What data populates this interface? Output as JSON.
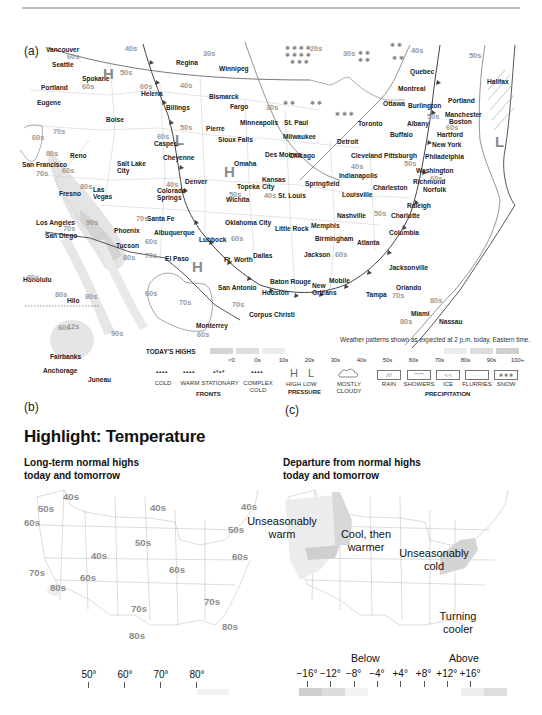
{
  "page": {
    "panels": {
      "a": "(a)",
      "b": "(b)",
      "c": "(c)"
    },
    "heading": "Highlight: Temperature"
  },
  "map_a": {
    "note": "Weather patterns shown as expected at 2 p.m. today, Eastern time.",
    "cities": [
      {
        "name": "Vancouver",
        "x": 46,
        "y": 47
      },
      {
        "name": "Seattle",
        "x": 52,
        "y": 62
      },
      {
        "name": "Spokane",
        "x": 82,
        "y": 76
      },
      {
        "name": "Portland",
        "x": 41,
        "y": 85
      },
      {
        "name": "Eugene",
        "x": 37,
        "y": 100
      },
      {
        "name": "Boise",
        "x": 106,
        "y": 117
      },
      {
        "name": "Helena",
        "x": 141,
        "y": 91
      },
      {
        "name": "Billings",
        "x": 166,
        "y": 105
      },
      {
        "name": "Regina",
        "x": 176,
        "y": 60
      },
      {
        "name": "Winnipeg",
        "x": 219,
        "y": 66
      },
      {
        "name": "Bismarck",
        "x": 209,
        "y": 94
      },
      {
        "name": "Fargo",
        "x": 230,
        "y": 104
      },
      {
        "name": "Minneapolis",
        "x": 240,
        "y": 120
      },
      {
        "name": "St. Paul",
        "x": 284,
        "y": 120
      },
      {
        "name": "Pierre",
        "x": 206,
        "y": 126
      },
      {
        "name": "Sioux Falls",
        "x": 218,
        "y": 137
      },
      {
        "name": "Casper",
        "x": 154,
        "y": 141
      },
      {
        "name": "Cheyenne",
        "x": 163,
        "y": 155
      },
      {
        "name": "Reno",
        "x": 70,
        "y": 153
      },
      {
        "name": "San Francisco",
        "x": 22,
        "y": 162
      },
      {
        "name": "Salt Lake\nCity",
        "x": 117,
        "y": 161
      },
      {
        "name": "Omaha",
        "x": 234,
        "y": 161
      },
      {
        "name": "Des Moines",
        "x": 265,
        "y": 152
      },
      {
        "name": "Chicago",
        "x": 289,
        "y": 153
      },
      {
        "name": "Milwaukee",
        "x": 283,
        "y": 134
      },
      {
        "name": "Detroit",
        "x": 337,
        "y": 139
      },
      {
        "name": "Toronto",
        "x": 358,
        "y": 121
      },
      {
        "name": "Ottawa",
        "x": 383,
        "y": 101
      },
      {
        "name": "Montreal",
        "x": 398,
        "y": 86
      },
      {
        "name": "Quebec",
        "x": 410,
        "y": 69
      },
      {
        "name": "Burlington",
        "x": 408,
        "y": 103
      },
      {
        "name": "Portland",
        "x": 448,
        "y": 98
      },
      {
        "name": "Manchester",
        "x": 445,
        "y": 112
      },
      {
        "name": "Boston",
        "x": 449,
        "y": 119
      },
      {
        "name": "Albany",
        "x": 407,
        "y": 121
      },
      {
        "name": "Buffalo",
        "x": 390,
        "y": 132
      },
      {
        "name": "Hartford",
        "x": 437,
        "y": 132
      },
      {
        "name": "New York",
        "x": 432,
        "y": 142
      },
      {
        "name": "Philadelphia",
        "x": 425,
        "y": 154
      },
      {
        "name": "Washington",
        "x": 416,
        "y": 168
      },
      {
        "name": "Richmond",
        "x": 413,
        "y": 179
      },
      {
        "name": "Norfolk",
        "x": 423,
        "y": 187
      },
      {
        "name": "Pittsburgh",
        "x": 384,
        "y": 153
      },
      {
        "name": "Cleveland",
        "x": 351,
        "y": 153
      },
      {
        "name": "Indianapolis",
        "x": 339,
        "y": 173
      },
      {
        "name": "Charleston",
        "x": 373,
        "y": 185
      },
      {
        "name": "Louisville",
        "x": 342,
        "y": 192
      },
      {
        "name": "Springfield",
        "x": 305,
        "y": 181
      },
      {
        "name": "Kansas\nCity",
        "x": 262,
        "y": 177
      },
      {
        "name": "St. Louis",
        "x": 278,
        "y": 193
      },
      {
        "name": "Topeka",
        "x": 237,
        "y": 184
      },
      {
        "name": "Wichita",
        "x": 226,
        "y": 197
      },
      {
        "name": "Denver",
        "x": 185,
        "y": 179
      },
      {
        "name": "Colorado\nSprings",
        "x": 157,
        "y": 188
      },
      {
        "name": "Fresno",
        "x": 59,
        "y": 191
      },
      {
        "name": "Las\nVegas",
        "x": 93,
        "y": 187
      },
      {
        "name": "Los Angeles",
        "x": 36,
        "y": 220
      },
      {
        "name": "San Diego",
        "x": 45,
        "y": 233
      },
      {
        "name": "Phoenix",
        "x": 114,
        "y": 228
      },
      {
        "name": "Tucson",
        "x": 116,
        "y": 243
      },
      {
        "name": "Santa Fe",
        "x": 147,
        "y": 216
      },
      {
        "name": "Albuquerque",
        "x": 154,
        "y": 230
      },
      {
        "name": "Oklahoma City",
        "x": 225,
        "y": 220
      },
      {
        "name": "Lubbock",
        "x": 199,
        "y": 237
      },
      {
        "name": "El Paso",
        "x": 165,
        "y": 256
      },
      {
        "name": "Dallas",
        "x": 253,
        "y": 253
      },
      {
        "name": "Ft. Worth",
        "x": 224,
        "y": 257
      },
      {
        "name": "Little Rock",
        "x": 275,
        "y": 226
      },
      {
        "name": "Memphis",
        "x": 311,
        "y": 223
      },
      {
        "name": "Nashville",
        "x": 337,
        "y": 213
      },
      {
        "name": "Birmingham",
        "x": 315,
        "y": 236
      },
      {
        "name": "Atlanta",
        "x": 357,
        "y": 240
      },
      {
        "name": "Charlotte",
        "x": 391,
        "y": 213
      },
      {
        "name": "Raleigh",
        "x": 407,
        "y": 203
      },
      {
        "name": "Columbia",
        "x": 389,
        "y": 230
      },
      {
        "name": "Jackson",
        "x": 304,
        "y": 252
      },
      {
        "name": "Jacksonville",
        "x": 389,
        "y": 265
      },
      {
        "name": "Mobile",
        "x": 329,
        "y": 278
      },
      {
        "name": "Baton Rouge",
        "x": 270,
        "y": 279
      },
      {
        "name": "New\nOrleans",
        "x": 312,
        "y": 283
      },
      {
        "name": "Houston",
        "x": 262,
        "y": 290
      },
      {
        "name": "San Antonio",
        "x": 218,
        "y": 285
      },
      {
        "name": "Corpus Christi",
        "x": 249,
        "y": 312
      },
      {
        "name": "Monterrey",
        "x": 196,
        "y": 323
      },
      {
        "name": "Tampa",
        "x": 366,
        "y": 292
      },
      {
        "name": "Orlando",
        "x": 396,
        "y": 285
      },
      {
        "name": "Miami",
        "x": 411,
        "y": 311
      },
      {
        "name": "Nassau",
        "x": 439,
        "y": 319
      },
      {
        "name": "Halifax",
        "x": 487,
        "y": 79
      },
      {
        "name": "Honolulu",
        "x": 23,
        "y": 277
      },
      {
        "name": "Hilo",
        "x": 67,
        "y": 298
      },
      {
        "name": "Fairbanks",
        "x": 50,
        "y": 354
      },
      {
        "name": "Anchorage",
        "x": 43,
        "y": 368
      },
      {
        "name": "Juneau",
        "x": 88,
        "y": 377
      }
    ],
    "temps": [
      {
        "t": "40s",
        "x": 125,
        "y": 45
      },
      {
        "t": "60s",
        "x": 67,
        "y": 53
      },
      {
        "t": "30s",
        "x": 203,
        "y": 50
      },
      {
        "t": "50s",
        "x": 120,
        "y": 69
      },
      {
        "t": "60s",
        "x": 82,
        "y": 83
      },
      {
        "t": "40s",
        "x": 180,
        "y": 82
      },
      {
        "t": "60s",
        "x": 140,
        "y": 83
      },
      {
        "t": "30s",
        "x": 266,
        "y": 104
      },
      {
        "t": "20s",
        "x": 310,
        "y": 45
      },
      {
        "t": "30s",
        "x": 343,
        "y": 50
      },
      {
        "t": "40s",
        "x": 411,
        "y": 47
      },
      {
        "t": "50s",
        "x": 469,
        "y": 52
      },
      {
        "t": "50s",
        "x": 180,
        "y": 124
      },
      {
        "t": "60s",
        "x": 157,
        "y": 133
      },
      {
        "t": "70s",
        "x": 53,
        "y": 128
      },
      {
        "t": "60s",
        "x": 32,
        "y": 134
      },
      {
        "t": "80s",
        "x": 46,
        "y": 150
      },
      {
        "t": "70s",
        "x": 36,
        "y": 170
      },
      {
        "t": "60s",
        "x": 62,
        "y": 167
      },
      {
        "t": "80s",
        "x": 80,
        "y": 183
      },
      {
        "t": "40s",
        "x": 166,
        "y": 181
      },
      {
        "t": "50s",
        "x": 229,
        "y": 191
      },
      {
        "t": "40s",
        "x": 264,
        "y": 192
      },
      {
        "t": "50s",
        "x": 427,
        "y": 113
      },
      {
        "t": "60s",
        "x": 446,
        "y": 124
      },
      {
        "t": "40s",
        "x": 351,
        "y": 163
      },
      {
        "t": "50s",
        "x": 404,
        "y": 160
      },
      {
        "t": "60s",
        "x": 430,
        "y": 175
      },
      {
        "t": "90s",
        "x": 86,
        "y": 219
      },
      {
        "t": "70s",
        "x": 63,
        "y": 225
      },
      {
        "t": "70s",
        "x": 136,
        "y": 215
      },
      {
        "t": "60s",
        "x": 145,
        "y": 238
      },
      {
        "t": "80s",
        "x": 123,
        "y": 254
      },
      {
        "t": "70s",
        "x": 145,
        "y": 252
      },
      {
        "t": "60s",
        "x": 231,
        "y": 235
      },
      {
        "t": "50s",
        "x": 374,
        "y": 210
      },
      {
        "t": "60s",
        "x": 335,
        "y": 251
      },
      {
        "t": "70s",
        "x": 179,
        "y": 299
      },
      {
        "t": "60s",
        "x": 145,
        "y": 290
      },
      {
        "t": "70s",
        "x": 232,
        "y": 301
      },
      {
        "t": "60s",
        "x": 197,
        "y": 331
      },
      {
        "t": "70s",
        "x": 392,
        "y": 292
      },
      {
        "t": "80s",
        "x": 430,
        "y": 297
      },
      {
        "t": "80s",
        "x": 400,
        "y": 318
      },
      {
        "t": "80s",
        "x": 27,
        "y": 274
      },
      {
        "t": "80s",
        "x": 55,
        "y": 291
      },
      {
        "t": "80s",
        "x": 85,
        "y": 293
      },
      {
        "t": "90s",
        "x": 111,
        "y": 330
      },
      {
        "t": "60s",
        "x": 58,
        "y": 324
      },
      {
        "t": "12s",
        "x": 67,
        "y": 323
      }
    ],
    "pressure": [
      {
        "t": "H",
        "x": 103,
        "y": 66
      },
      {
        "t": "L",
        "x": 175,
        "y": 132
      },
      {
        "t": "H",
        "x": 224,
        "y": 164
      },
      {
        "t": "H",
        "x": 192,
        "y": 259
      },
      {
        "t": "L",
        "x": 495,
        "y": 134
      }
    ],
    "legend": {
      "highs_title": "TODAY'S HIGHS",
      "highs": [
        {
          "label": "<0",
          "color": "#d4d4d4"
        },
        {
          "label": "0s",
          "color": "#dedede"
        },
        {
          "label": "10s",
          "color": "#ececec"
        },
        {
          "label": "20s",
          "color": "#ffffff"
        },
        {
          "label": "30s",
          "color": "#ffffff"
        },
        {
          "label": "40s",
          "color": "#ffffff"
        },
        {
          "label": "50s",
          "color": "#ffffff"
        },
        {
          "label": "60s",
          "color": "#ffffff"
        },
        {
          "label": "70s",
          "color": "#ffffff"
        },
        {
          "label": "80s",
          "color": "#ececec"
        },
        {
          "label": "90s",
          "color": "#dcdcdc"
        },
        {
          "label": "100+",
          "color": "#cfcfcf"
        }
      ],
      "fronts": {
        "group": "FRONTS",
        "items": [
          "COLD",
          "WARM",
          "STATIONARY",
          "COMPLEX\nCOLD"
        ]
      },
      "pressure": {
        "group": "PRESSURE",
        "high": "HIGH",
        "low": "LOW",
        "h": "H",
        "l": "L"
      },
      "cloudy": "MOSTLY\nCLOUDY",
      "precip": {
        "group": "PRECIPITATION",
        "items": [
          "RAIN",
          "SHOWERS",
          "ICE",
          "FLURRIES",
          "SNOW"
        ]
      }
    }
  },
  "map_b": {
    "title": "Long-term normal highs\ntoday and tomorrow",
    "temps": [
      {
        "t": "40s",
        "x": 63,
        "y": 491
      },
      {
        "t": "50s",
        "x": 38,
        "y": 503
      },
      {
        "t": "60s",
        "x": 24,
        "y": 517
      },
      {
        "t": "40s",
        "x": 150,
        "y": 502
      },
      {
        "t": "50s",
        "x": 135,
        "y": 537
      },
      {
        "t": "40s",
        "x": 91,
        "y": 550
      },
      {
        "t": "70s",
        "x": 29,
        "y": 567
      },
      {
        "t": "60s",
        "x": 80,
        "y": 572
      },
      {
        "t": "80s",
        "x": 50,
        "y": 582
      },
      {
        "t": "60s",
        "x": 169,
        "y": 564
      },
      {
        "t": "40s",
        "x": 241,
        "y": 501
      },
      {
        "t": "50s",
        "x": 228,
        "y": 524
      },
      {
        "t": "60s",
        "x": 232,
        "y": 551
      },
      {
        "t": "70s",
        "x": 204,
        "y": 596
      },
      {
        "t": "70s",
        "x": 131,
        "y": 603
      },
      {
        "t": "80s",
        "x": 129,
        "y": 630
      },
      {
        "t": "80s",
        "x": 222,
        "y": 621
      }
    ],
    "scale": [
      "50°",
      "60°",
      "70°",
      "80°"
    ]
  },
  "map_c": {
    "title": "Departure from normal highs\ntoday and tomorrow",
    "annotations": [
      {
        "t": "Unseasonably\nwarm",
        "x": 282,
        "y": 515
      },
      {
        "t": "Cool, then\nwarmer",
        "x": 366,
        "y": 528
      },
      {
        "t": "Unseasonably\ncold",
        "x": 434,
        "y": 547
      },
      {
        "t": "Turning\ncooler",
        "x": 458,
        "y": 610
      }
    ],
    "scale": {
      "below": "Below",
      "above": "Above",
      "ticks": [
        "−16°",
        "−12°",
        "−8°",
        "−4°",
        "+4°",
        "+8°",
        "+12°",
        "+16°"
      ]
    }
  }
}
